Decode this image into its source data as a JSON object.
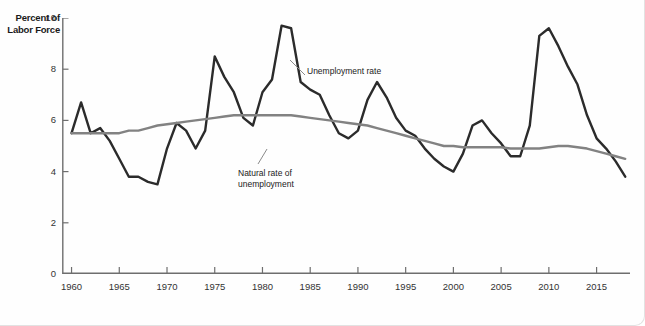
{
  "chart_data": {
    "type": "line",
    "title": "",
    "subtitle": "",
    "xlabel": "",
    "ylabel": "Percent of\nLabor Force",
    "ylim": [
      0,
      10
    ],
    "xlim": [
      1959,
      2018.5
    ],
    "yticks": [
      0,
      2,
      4,
      6,
      8,
      10
    ],
    "xticks": [
      1960,
      1965,
      1970,
      1975,
      1980,
      1985,
      1990,
      1995,
      2000,
      2005,
      2010,
      2015
    ],
    "ytick_labels": [
      "0",
      "2",
      "4",
      "6",
      "8",
      "10"
    ],
    "xtick_labels": [
      "1960",
      "1965",
      "1970",
      "1975",
      "1980",
      "1985",
      "1990",
      "1995",
      "2000",
      "2005",
      "2010",
      "2015"
    ],
    "grid": false,
    "legend_position": "inline-annotations",
    "annotations": [
      {
        "name": "unemployment-rate-label",
        "text": "Unemployment rate",
        "x": 1984.5,
        "y": 9.2
      },
      {
        "name": "natural-rate-label",
        "text": "Natural rate of\nunemployment",
        "x": 1977.5,
        "y": 5.1
      }
    ],
    "series": [
      {
        "name": "Unemployment rate",
        "color": "#2b2b2b",
        "width": 2.4,
        "x": [
          1960,
          1961,
          1962,
          1963,
          1964,
          1965,
          1966,
          1967,
          1968,
          1969,
          1970,
          1971,
          1972,
          1973,
          1974,
          1975,
          1976,
          1977,
          1978,
          1979,
          1980,
          1981,
          1982,
          1983,
          1984,
          1985,
          1986,
          1987,
          1988,
          1989,
          1990,
          1991,
          1992,
          1993,
          1994,
          1995,
          1996,
          1997,
          1998,
          1999,
          2000,
          2001,
          2002,
          2003,
          2004,
          2005,
          2006,
          2007,
          2008,
          2009,
          2010,
          2011,
          2012,
          2013,
          2014,
          2015,
          2016,
          2017,
          2018
        ],
        "values": [
          5.5,
          6.7,
          5.5,
          5.7,
          5.2,
          4.5,
          3.8,
          3.8,
          3.6,
          3.5,
          4.9,
          5.9,
          5.6,
          4.9,
          5.6,
          8.5,
          7.7,
          7.1,
          6.1,
          5.8,
          7.1,
          7.6,
          9.7,
          9.6,
          7.5,
          7.2,
          7.0,
          6.2,
          5.5,
          5.3,
          5.6,
          6.8,
          7.5,
          6.9,
          6.1,
          5.6,
          5.4,
          4.9,
          4.5,
          4.2,
          4.0,
          4.7,
          5.8,
          6.0,
          5.5,
          5.1,
          4.6,
          4.6,
          5.8,
          9.3,
          9.6,
          8.9,
          8.1,
          7.4,
          6.2,
          5.3,
          4.9,
          4.4,
          3.8
        ]
      },
      {
        "name": "Natural rate of unemployment",
        "color": "#828282",
        "width": 2.4,
        "x": [
          1960,
          1961,
          1962,
          1963,
          1964,
          1965,
          1966,
          1967,
          1968,
          1969,
          1970,
          1971,
          1972,
          1973,
          1974,
          1975,
          1976,
          1977,
          1978,
          1979,
          1980,
          1981,
          1982,
          1983,
          1984,
          1985,
          1986,
          1987,
          1988,
          1989,
          1990,
          1991,
          1992,
          1993,
          1994,
          1995,
          1996,
          1997,
          1998,
          1999,
          2000,
          2001,
          2002,
          2003,
          2004,
          2005,
          2006,
          2007,
          2008,
          2009,
          2010,
          2011,
          2012,
          2013,
          2014,
          2015,
          2016,
          2017,
          2018
        ],
        "values": [
          5.5,
          5.5,
          5.5,
          5.5,
          5.5,
          5.5,
          5.6,
          5.6,
          5.7,
          5.8,
          5.85,
          5.9,
          5.95,
          6.0,
          6.05,
          6.1,
          6.15,
          6.2,
          6.2,
          6.2,
          6.2,
          6.2,
          6.2,
          6.2,
          6.15,
          6.1,
          6.05,
          6.0,
          5.95,
          5.9,
          5.85,
          5.8,
          5.7,
          5.6,
          5.5,
          5.4,
          5.3,
          5.2,
          5.1,
          5.0,
          5.0,
          4.95,
          4.95,
          4.95,
          4.95,
          4.95,
          4.9,
          4.9,
          4.9,
          4.9,
          4.95,
          5.0,
          5.0,
          4.95,
          4.9,
          4.8,
          4.7,
          4.6,
          4.5
        ]
      }
    ]
  },
  "axis": {
    "y_title": "Percent of\nLabor Force",
    "y_title_line1": "Percent of",
    "y_title_line2": "Labor Force"
  },
  "colors": {
    "unemployment_line": "#2b2b2b",
    "natural_line": "#828282",
    "axis": "#6e6e6e",
    "text": "#1a1a1a",
    "background": "#fefefe"
  }
}
